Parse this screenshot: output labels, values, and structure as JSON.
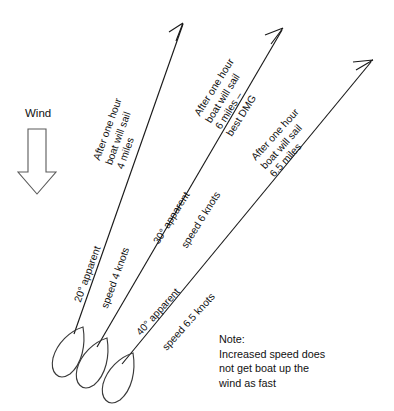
{
  "diagram": {
    "background_color": "#ffffff",
    "line_color": "#1a1a1a",
    "text_color": "#111111"
  },
  "wind": {
    "label": "Wind",
    "direction": "down",
    "icon": "block-arrow-down-icon"
  },
  "courses": [
    {
      "id": "course-20",
      "angle_label": "20° apparent",
      "speed_label": "speed 4 knots",
      "distance_label": "After one hour\nboat will sail\n4 miles",
      "angle_degrees": 20,
      "speed_knots": 4,
      "distance_miles": 4,
      "best_dmg": false
    },
    {
      "id": "course-30",
      "angle_label": "30° apparent",
      "speed_label": "speed 6 knots",
      "distance_label": "After one hour\nboat will sail\n6 miles –\nbest DMG",
      "angle_degrees": 30,
      "speed_knots": 6,
      "distance_miles": 6,
      "best_dmg": true
    },
    {
      "id": "course-40",
      "angle_label": "40° apparent",
      "speed_label": "speed 6.5 knots",
      "distance_label": "After one hour\nboat will sail\n6.5 miles",
      "angle_degrees": 40,
      "speed_knots": 6.5,
      "distance_miles": 6.5,
      "best_dmg": false
    }
  ],
  "note": {
    "text": "Note:\nIncreased speed does\nnot get boat up the\nwind as fast"
  }
}
